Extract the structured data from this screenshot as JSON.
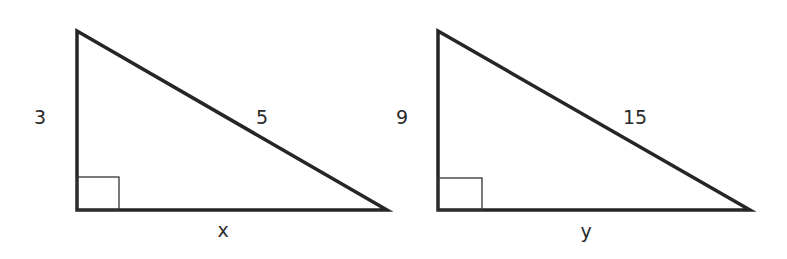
{
  "diagram": {
    "stroke_color": "#262626",
    "triangles": [
      {
        "id": "triangle-1",
        "vertical_leg_label": "3",
        "hypotenuse_label": "5",
        "base_label": "x",
        "vertices": {
          "top": [
            77,
            31
          ],
          "right_angle": [
            77,
            210
          ],
          "right": [
            387,
            210
          ]
        },
        "right_angle_marker": true
      },
      {
        "id": "triangle-2",
        "vertical_leg_label": "9",
        "hypotenuse_label": "15",
        "base_label": "y",
        "vertices": {
          "top": [
            438,
            31
          ],
          "right_angle": [
            438,
            210
          ],
          "right": [
            750,
            210
          ]
        },
        "right_angle_marker": true
      }
    ]
  }
}
